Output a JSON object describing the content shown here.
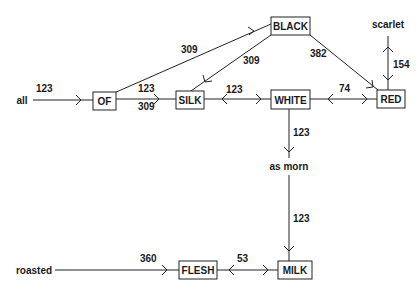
{
  "diagram": {
    "nodes": [
      {
        "id": "OF",
        "label": "OF",
        "boxed": true
      },
      {
        "id": "SILK",
        "label": "SILK",
        "boxed": true
      },
      {
        "id": "BLACK",
        "label": "BLACK",
        "boxed": true
      },
      {
        "id": "WHITE",
        "label": "WHITE",
        "boxed": true
      },
      {
        "id": "RED",
        "label": "RED",
        "boxed": true
      },
      {
        "id": "MILK",
        "label": "MILK",
        "boxed": true
      },
      {
        "id": "FLESH",
        "label": "FLESH",
        "boxed": true
      },
      {
        "id": "all",
        "label": "all",
        "boxed": false
      },
      {
        "id": "scarlet",
        "label": "scarlet",
        "boxed": false
      },
      {
        "id": "as_morn",
        "label": "as morn",
        "boxed": false
      },
      {
        "id": "roasted",
        "label": "roasted",
        "boxed": false
      }
    ],
    "edges": [
      {
        "from": "all",
        "to": "OF",
        "label": "123",
        "direction": "forward"
      },
      {
        "from": "OF",
        "to": "SILK",
        "label": "123",
        "label2": "309",
        "direction": "forward"
      },
      {
        "from": "OF",
        "to": "BLACK",
        "label": "309",
        "direction": "forward"
      },
      {
        "from": "BLACK",
        "to": "SILK",
        "label": "309",
        "direction": "forward"
      },
      {
        "from": "BLACK",
        "to": "RED",
        "label": "382",
        "direction": "forward"
      },
      {
        "from": "SILK",
        "to": "WHITE",
        "label": "123",
        "direction": "both"
      },
      {
        "from": "WHITE",
        "to": "RED",
        "label": "74",
        "direction": "both"
      },
      {
        "from": "RED",
        "to": "scarlet",
        "label": "154",
        "direction": "both"
      },
      {
        "from": "WHITE",
        "to": "as_morn",
        "label": "123",
        "direction": "forward"
      },
      {
        "from": "as_morn",
        "to": "MILK",
        "label": "123",
        "direction": "forward"
      },
      {
        "from": "FLESH",
        "to": "MILK",
        "label": "53",
        "direction": "both"
      },
      {
        "from": "roasted",
        "to": "FLESH",
        "label": "360",
        "direction": "forward"
      }
    ]
  }
}
